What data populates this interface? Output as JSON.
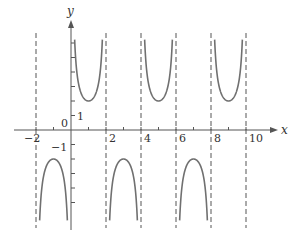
{
  "chart_data": {
    "type": "line",
    "title": "",
    "function": "y = 2 csc(pi x / 2)",
    "xlabel": "x",
    "ylabel": "y",
    "xlim": [
      -2.5,
      11.5
    ],
    "ylim": [
      -6.5,
      6.5
    ],
    "x_tick_labels": [
      "-2",
      "2",
      "4",
      "6",
      "8",
      "10"
    ],
    "x_ticks": [
      -2,
      -1,
      1,
      2,
      3,
      4,
      5,
      6,
      7,
      8,
      9,
      10
    ],
    "y_tick_labels": [
      "1",
      "-1"
    ],
    "origin_label": "0",
    "y_ticks": [
      -5,
      -4,
      -3,
      -2,
      -1,
      1,
      2,
      3,
      4,
      5,
      6
    ],
    "vertical_asymptotes": [
      -2,
      0,
      2,
      4,
      6,
      8,
      10
    ],
    "branches": [
      {
        "interval": [
          -2,
          0
        ],
        "direction": "up",
        "vertex": [
          -1,
          2
        ]
      },
      {
        "interval": [
          0,
          2
        ],
        "direction": "down",
        "vertex": [
          1,
          -2
        ]
      },
      {
        "interval": [
          2,
          4
        ],
        "direction": "up",
        "vertex": [
          3,
          2
        ]
      },
      {
        "interval": [
          4,
          6
        ],
        "direction": "down",
        "vertex": [
          5,
          -2
        ]
      },
      {
        "interval": [
          6,
          8
        ],
        "direction": "up",
        "vertex": [
          7,
          2
        ]
      },
      {
        "interval": [
          8,
          10
        ],
        "direction": "down",
        "vertex": [
          9,
          -2
        ]
      }
    ],
    "grid": false,
    "legend": null,
    "colors": {
      "curve": "#707070",
      "axis": "#555555",
      "asymptote": "#555555"
    }
  }
}
